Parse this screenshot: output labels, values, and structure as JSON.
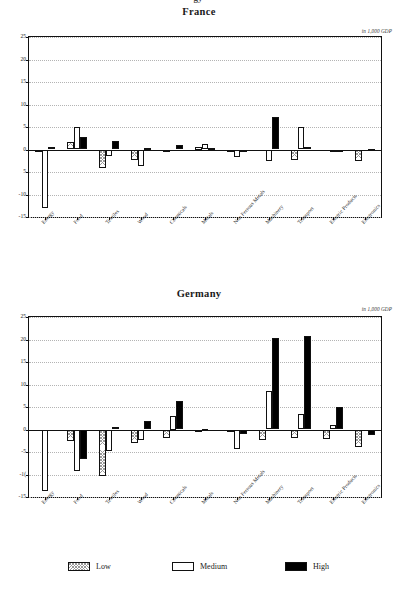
{
  "page": {
    "top_partial_text": "gy"
  },
  "legend": {
    "items": [
      {
        "key": "low",
        "label": "Low"
      },
      {
        "key": "medium",
        "label": "Medium"
      },
      {
        "key": "high",
        "label": "High"
      }
    ]
  },
  "axis": {
    "yticks": [
      25,
      20,
      15,
      10,
      5,
      0,
      -5,
      -10,
      -15
    ],
    "ytick_labels_france": [
      "25",
      "20",
      "15",
      "10",
      "5",
      "0",
      "5",
      "-10",
      "-15"
    ],
    "ytick_labels_germany": [
      "25",
      "20",
      "15",
      "10",
      "5",
      "0",
      "-5",
      "-1(",
      "-15"
    ],
    "ylim": [
      -15,
      25
    ],
    "categories": [
      "Energy",
      "Food",
      "Textiles",
      "Wood",
      "Chemicals",
      "Metals",
      "Non Ferrous Metals",
      "Machinery",
      "Transport",
      "Electric Products",
      "Electronics"
    ]
  },
  "charts": [
    {
      "id": "france",
      "title": "France",
      "unit_note": "in 1,000 GDP"
    },
    {
      "id": "germany",
      "title": "Germany",
      "unit_note": "in 1,000 GDP"
    }
  ],
  "chart_data": [
    {
      "type": "bar",
      "title": "France",
      "subtitle": "in 1,000 GDP",
      "xlabel": "",
      "ylabel": "",
      "ylim": [
        -15,
        25
      ],
      "yticks": [
        -15,
        -10,
        -5,
        0,
        5,
        10,
        15,
        20,
        25
      ],
      "grid": true,
      "legend_position": "bottom-shared",
      "categories": [
        "Energy",
        "Food",
        "Textiles",
        "Wood",
        "Chemicals",
        "Metals",
        "Non Ferrous Metals",
        "Machinery",
        "Transport",
        "Electric Products",
        "Electronics"
      ],
      "series": [
        {
          "name": "Low",
          "values": [
            -0.6,
            1.7,
            -4.0,
            -2.3,
            -0.3,
            0.5,
            -0.5,
            0.0,
            -2.4,
            0.0,
            -2.6
          ]
        },
        {
          "name": "Medium",
          "values": [
            -13.1,
            4.9,
            -1.4,
            -3.7,
            0.0,
            1.3,
            -1.6,
            -2.5,
            4.9,
            -0.1,
            0.0
          ]
        },
        {
          "name": "High",
          "values": [
            0.6,
            2.7,
            1.8,
            0.3,
            0.9,
            0.3,
            -0.4,
            7.3,
            0.6,
            -0.1,
            0.2
          ]
        }
      ]
    },
    {
      "type": "bar",
      "title": "Germany",
      "subtitle": "in 1,000 GDP",
      "xlabel": "",
      "ylabel": "",
      "ylim": [
        -15,
        25
      ],
      "yticks": [
        -15,
        -10,
        -5,
        0,
        5,
        10,
        15,
        20,
        25
      ],
      "grid": true,
      "legend_position": "bottom-shared",
      "categories": [
        "Energy",
        "Food",
        "Textiles",
        "Wood",
        "Chemicals",
        "Metals",
        "Non Ferrous Metals",
        "Machinery",
        "Transport",
        "Electric Products",
        "Electronics"
      ],
      "series": [
        {
          "name": "Low",
          "values": [
            0.0,
            -2.6,
            -10.3,
            -2.9,
            -1.9,
            -0.3,
            -0.4,
            -2.3,
            -1.9,
            -2.0,
            -3.9
          ]
        },
        {
          "name": "Medium",
          "values": [
            -13.6,
            -9.3,
            -4.7,
            -2.4,
            3.0,
            0.2,
            -4.4,
            8.6,
            3.4,
            0.9,
            0.0
          ]
        },
        {
          "name": "High",
          "values": [
            0.0,
            -6.5,
            0.6,
            1.9,
            6.3,
            0.0,
            -1.0,
            20.4,
            20.8,
            4.9,
            -1.2
          ]
        }
      ]
    }
  ]
}
